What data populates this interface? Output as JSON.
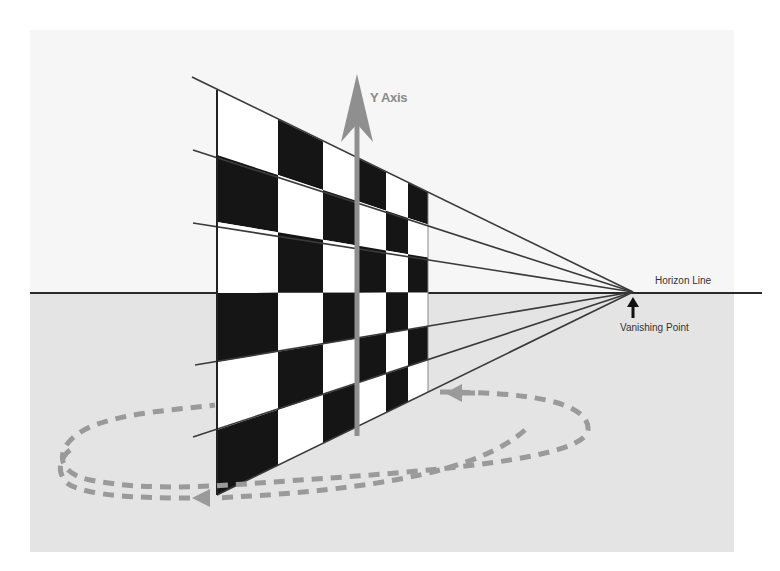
{
  "diagram": {
    "type": "one-point-perspective",
    "labels": {
      "y_axis": "Y Axis",
      "horizon_line": "Horizon Line",
      "vanishing_point": "Vanishing Point"
    },
    "colors": {
      "background_sky": "#f6f6f6",
      "background_ground": "#e4e4e4",
      "checker_dark": "#151515",
      "checker_light": "#ffffff",
      "axis_arrow": "#8f8f8f",
      "rotation_path": "#9a9a9a",
      "lines": "#3a3a3a"
    },
    "vanishing_point": {
      "x": 633,
      "y": 292
    },
    "horizon_y": 292,
    "checkerboard": {
      "columns": 6,
      "rows": 8,
      "near_edge_x": 217,
      "far_edge_x": 428
    },
    "rotation_indicator": "dashed elliptical arrow around the Y axis"
  }
}
